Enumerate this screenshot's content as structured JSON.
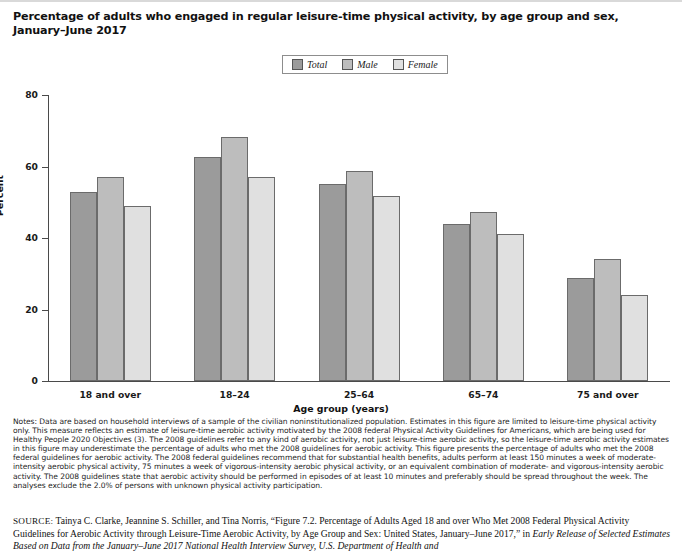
{
  "title": "Percentage of adults who engaged in regular leisure-time physical activity, by age group and sex, January–June 2017",
  "legend": {
    "items": [
      {
        "label": "Total",
        "color": "#9b9b9b"
      },
      {
        "label": "Male",
        "color": "#bdbdbd"
      },
      {
        "label": "Female",
        "color": "#e0e0e0"
      }
    ]
  },
  "axes": {
    "ylabel": "Percent",
    "xlabel": "Age group (years)",
    "yticks": [
      "0",
      "20",
      "40",
      "60",
      "80"
    ]
  },
  "chart_data": {
    "type": "bar",
    "title": "Percentage of adults who engaged in regular leisure-time physical activity, by age group and sex, January–June 2017",
    "xlabel": "Age group (years)",
    "ylabel": "Percent",
    "ylim": [
      0,
      80
    ],
    "yticks": [
      0,
      20,
      40,
      60,
      80
    ],
    "grid": false,
    "legend_position": "top-center",
    "categories": [
      "18 and over",
      "18–24",
      "25–64",
      "65–74",
      "75 and over"
    ],
    "series": [
      {
        "name": "Total",
        "color": "#9b9b9b",
        "values": [
          53.0,
          62.8,
          55.1,
          44.0,
          28.7
        ]
      },
      {
        "name": "Male",
        "color": "#bdbdbd",
        "values": [
          57.2,
          68.2,
          58.7,
          47.2,
          34.1
        ]
      },
      {
        "name": "Female",
        "color": "#e0e0e0",
        "values": [
          48.9,
          57.2,
          51.7,
          41.0,
          24.0
        ]
      }
    ]
  },
  "notes": "Notes: Data are based on household interviews of a sample of the civilian noninstitutionalized population. Estimates in this figure are limited to leisure-time physical activity only. This measure reflects an estimate of leisure-time aerobic activity motivated by the 2008 federal Physical Activity Guidelines for Americans, which are being used for Healthy People 2020 Objectives (3). The 2008 guidelines refer to any kind of aerobic activity, not just leisure-time aerobic activity, so the leisure-time aerobic activity estimates in this figure may underestimate the percentage of adults who met the 2008 guidelines for aerobic activity. This figure presents the percentage of adults who met the 2008 federal guidelines for aerobic activity. The 2008 federal guidelines recommend that for substantial health benefits, adults perform at least 150 minutes a week of moderate-intensity aerobic physical activity, 75 minutes a week of vigorous-intensity aerobic physical activity, or an equivalent combination of moderate- and vigorous-intensity aerobic activity. The 2008 guidelines state that aerobic activity should be performed in episodes of at least 10 minutes and preferably should be spread throughout the week. The analyses exclude the 2.0% of persons with unknown physical activity participation.",
  "source": {
    "kicker": "SOURCE:",
    "line1": "Tainya C. Clarke, Jeannine S. Schiller, and Tina Norris, “Figure 7.2. Percentage of Adults Aged 18 and over Who Met 2008 Federal Physical",
    "line2": "Activity Guidelines for Aerobic Activity through Leisure-Time Aerobic Activity, by Age Group and Sex: United States, January–June 2017,” in ",
    "line2_italic": "Early",
    "line3_clipped": "Release of Selected Estimates Based on Data from the January–June 2017 National Health Interview Survey, U.S. Department of Health and"
  }
}
